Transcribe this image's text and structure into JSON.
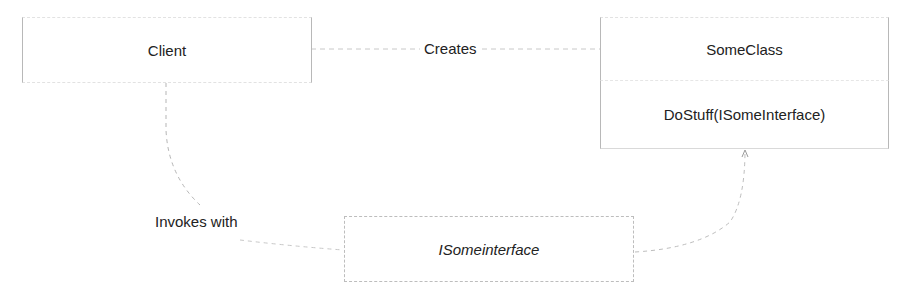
{
  "diagram": {
    "nodes": {
      "client": {
        "label": "Client"
      },
      "some_class": {
        "title": "SomeClass",
        "method": "DoStuff(ISomeInterface)"
      },
      "interface": {
        "label": "ISomeinterface"
      }
    },
    "edges": {
      "creates": {
        "label": "Creates"
      },
      "invokes_with": {
        "label": "Invokes with"
      }
    },
    "colors": {
      "line": "#bdbdbd",
      "text": "#222222",
      "background": "#ffffff"
    }
  }
}
